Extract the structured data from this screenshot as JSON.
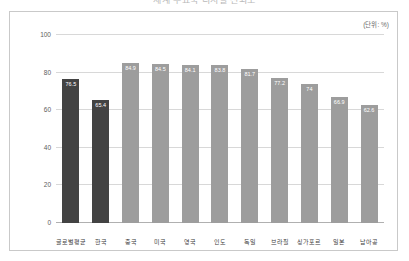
{
  "page": {
    "cropped_title": "세계 주요국 디지털 신뢰도",
    "background_color": "#ffffff"
  },
  "chart": {
    "unit_label": "(단위: %)",
    "frame_border_color": "#c9c9c9",
    "bar_color_default": "#9d9d9d",
    "bar_color_highlight": "#434343",
    "value_label_color": "#ffffff"
  },
  "chart_data": {
    "type": "bar",
    "title": "세계 주요국 디지털 신뢰도",
    "xlabel": "",
    "ylabel": "",
    "unit": "%",
    "ylim": [
      0,
      100
    ],
    "yticks": [
      0,
      20,
      40,
      60,
      80,
      100
    ],
    "ytick_labels": [
      "0",
      "20",
      "40",
      "60",
      "80",
      "100"
    ],
    "grid": true,
    "legend": false,
    "categories": [
      "글로벌평균",
      "한국",
      "중국",
      "미국",
      "영국",
      "인도",
      "독일",
      "브라질",
      "싱가포르",
      "일본",
      "남아공"
    ],
    "values": [
      76.5,
      65.4,
      84.9,
      84.5,
      84.1,
      83.8,
      81.7,
      77.2,
      74,
      66.9,
      62.6
    ],
    "value_labels": [
      "76.5",
      "65.4",
      "84.9",
      "84.5",
      "84.1",
      "83.8",
      "81.7",
      "77.2",
      "74",
      "66.9",
      "62.6"
    ],
    "highlighted": [
      true,
      true,
      false,
      false,
      false,
      false,
      false,
      false,
      false,
      false,
      false
    ]
  }
}
